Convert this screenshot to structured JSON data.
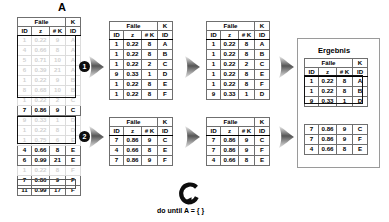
{
  "diagram": {
    "source_label": "A",
    "result_label": "Ergebnis",
    "loop_caption": "do until A = { }",
    "loop_icon": "circular-arrow-icon",
    "arrow_icon": "right-block-arrow-icon",
    "step_badges": [
      "1",
      "2"
    ],
    "colors": {
      "ghost_text": "#d2d2d2",
      "highlight_border": "#111111",
      "table_border": "#6f6f6f",
      "badge_fill": "#0d0d0d",
      "frame_border": "#9a9a9a"
    }
  },
  "columns": {
    "group_cases": "Fälle",
    "group_k": "K",
    "sub": [
      "ID",
      "z",
      "# K",
      "ID"
    ]
  },
  "table_a": {
    "rows": [
      {
        "id": "1",
        "z": "0.22",
        "k": "9",
        "kid": "A",
        "ghost": true
      },
      {
        "id": "4",
        "z": "0.66",
        "k": "8",
        "kid": "A",
        "ghost": true
      },
      {
        "id": "5",
        "z": "0.71",
        "k": "10",
        "kid": "A",
        "ghost": true
      },
      {
        "id": "6",
        "z": "0.39",
        "k": "21",
        "kid": "A",
        "ghost": true
      },
      {
        "id": "1",
        "z": "0.22",
        "k": "9",
        "kid": "B",
        "ghost": true
      },
      {
        "id": "8",
        "z": "0.68",
        "k": "10",
        "kid": "B",
        "ghost": true
      },
      {
        "id": "1",
        "z": "0.22",
        "k": "2",
        "kid": "C",
        "ghost": true
      },
      {
        "id": "7",
        "z": "0.86",
        "k": "9",
        "kid": "C",
        "ghost": false
      },
      {
        "id": "9",
        "z": "0.33",
        "k": "1",
        "kid": "D",
        "ghost": true
      },
      {
        "id": "1",
        "z": "0.22",
        "k": "8",
        "kid": "D",
        "ghost": true
      },
      {
        "id": "1",
        "z": "0.75",
        "k": "6",
        "kid": "E",
        "ghost": true
      },
      {
        "id": "4",
        "z": "0.66",
        "k": "8",
        "kid": "E",
        "ghost": false
      },
      {
        "id": "6",
        "z": "0.99",
        "k": "21",
        "kid": "E",
        "ghost": false
      },
      {
        "id": "1",
        "z": "0.22",
        "k": "8",
        "kid": "F",
        "ghost": true
      },
      {
        "id": "7",
        "z": "0.86",
        "k": "9",
        "kid": "F",
        "ghost": false
      },
      {
        "id": "11",
        "z": "0.99",
        "k": "17",
        "kid": "F",
        "ghost": false
      }
    ]
  },
  "stage2_top": {
    "rows": [
      {
        "id": "1",
        "z": "0.22",
        "k": "8",
        "kid": "A"
      },
      {
        "id": "1",
        "z": "0.22",
        "k": "8",
        "kid": "B"
      },
      {
        "id": "1",
        "z": "0.22",
        "k": "2",
        "kid": "C"
      },
      {
        "id": "9",
        "z": "0.33",
        "k": "1",
        "kid": "D"
      },
      {
        "id": "1",
        "z": "0.22",
        "k": "8",
        "kid": "E"
      },
      {
        "id": "1",
        "z": "0.22",
        "k": "8",
        "kid": "F"
      }
    ]
  },
  "stage2_bottom": {
    "rows": [
      {
        "id": "7",
        "z": "0.86",
        "k": "9",
        "kid": "C"
      },
      {
        "id": "4",
        "z": "0.66",
        "k": "8",
        "kid": "E"
      },
      {
        "id": "7",
        "z": "0.86",
        "k": "9",
        "kid": "F"
      }
    ]
  },
  "stage3_top": {
    "rows": [
      {
        "id": "1",
        "z": "0.22",
        "k": "8",
        "kid": "A"
      },
      {
        "id": "1",
        "z": "0.22",
        "k": "8",
        "kid": "B"
      },
      {
        "id": "1",
        "z": "0.22",
        "k": "2",
        "kid": "C"
      },
      {
        "id": "1",
        "z": "0.22",
        "k": "8",
        "kid": "E"
      },
      {
        "id": "1",
        "z": "0.22",
        "k": "8",
        "kid": "F"
      },
      {
        "id": "9",
        "z": "0.33",
        "k": "1",
        "kid": "D"
      }
    ]
  },
  "stage3_bottom": {
    "rows": [
      {
        "id": "7",
        "z": "0.86",
        "k": "9",
        "kid": "C"
      },
      {
        "id": "7",
        "z": "0.86",
        "k": "9",
        "kid": "F"
      },
      {
        "id": "4",
        "z": "0.66",
        "k": "8",
        "kid": "E"
      }
    ]
  },
  "result_top": {
    "rows": [
      {
        "id": "1",
        "z": "0.22",
        "k": "8",
        "kid": "A"
      },
      {
        "id": "1",
        "z": "0.22",
        "k": "8",
        "kid": "B"
      },
      {
        "id": "9",
        "z": "0.33",
        "k": "1",
        "kid": "D"
      }
    ]
  },
  "result_bottom": {
    "rows": [
      {
        "id": "7",
        "z": "0.86",
        "k": "9",
        "kid": "C"
      },
      {
        "id": "7",
        "z": "0.86",
        "k": "9",
        "kid": "F"
      },
      {
        "id": "4",
        "z": "0.66",
        "k": "8",
        "kid": "E"
      }
    ]
  }
}
